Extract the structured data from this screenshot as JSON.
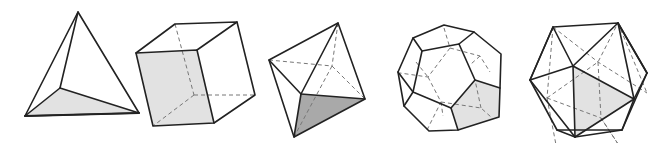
{
  "figure": {
    "colors": {
      "edge": "#222222",
      "hidden_edge": "#777777",
      "shade_light": "#e2e2e2",
      "shade_dark": "#a9a9a9",
      "background": "#ffffff"
    },
    "solids": [
      {
        "name": "tetrahedron",
        "faces": 4,
        "shaded_face": "bottom"
      },
      {
        "name": "cube",
        "faces": 6,
        "shaded_face": "front"
      },
      {
        "name": "octahedron",
        "faces": 8,
        "shaded_face": "lower-front"
      },
      {
        "name": "dodecahedron",
        "faces": 12,
        "shaded_face": "lower-right pentagon"
      },
      {
        "name": "icosahedron",
        "faces": 20,
        "shaded_face": "center triangle"
      }
    ]
  }
}
